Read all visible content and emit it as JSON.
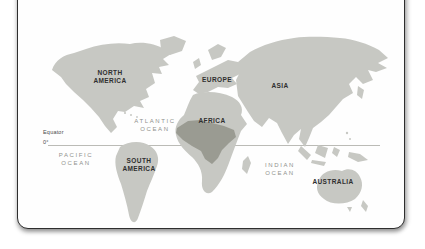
{
  "map": {
    "continent_labels": [
      {
        "id": "north-america",
        "text": "NORTH\nAMERICA"
      },
      {
        "id": "europe",
        "text": "EUROPE"
      },
      {
        "id": "asia",
        "text": "ASIA"
      },
      {
        "id": "africa",
        "text": "AFRICA"
      },
      {
        "id": "south-america",
        "text": "SOUTH\nAMERICA"
      },
      {
        "id": "australia",
        "text": "AUSTRALIA"
      }
    ],
    "ocean_labels": [
      {
        "id": "atlantic-ocean",
        "text": "ATLANTIC\nOCEAN"
      },
      {
        "id": "pacific-ocean",
        "text": "PACIFIC\nOCEAN"
      },
      {
        "id": "indian-ocean",
        "text": "INDIAN\nOCEAN"
      }
    ],
    "equator": {
      "label": "Equator",
      "degree": "0°"
    },
    "colors": {
      "land": "#c7c8c3",
      "highlight": "#9a9b92",
      "ocean": "#ffffff",
      "equator_line": "#b3b3ae"
    }
  }
}
